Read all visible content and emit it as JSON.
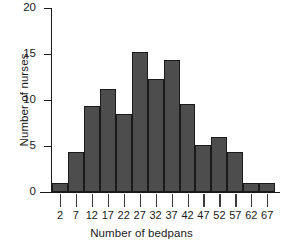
{
  "chart_data": {
    "type": "bar",
    "title": "",
    "subtitle": "",
    "xlabel": "Number of bedpans",
    "ylabel": "Number of nurses",
    "categories": [
      "2",
      "7",
      "12",
      "17",
      "22",
      "27",
      "32",
      "37",
      "42",
      "47",
      "52",
      "57",
      "62",
      "67"
    ],
    "values": [
      1,
      4.3,
      9.4,
      11.2,
      8.5,
      15.2,
      12.3,
      14.3,
      9.6,
      5.1,
      6,
      4.4,
      1,
      1
    ],
    "x_tick_labels": [
      "2",
      "7",
      "12",
      "17",
      "22",
      "27",
      "32",
      "37",
      "42",
      "47",
      "52",
      "57",
      "62",
      "67"
    ],
    "y_tick_labels": [
      "0",
      "5",
      "10",
      "15",
      "20"
    ],
    "y_tick_values": [
      0,
      5,
      10,
      15,
      20
    ],
    "ylim": [
      0,
      20
    ],
    "grid": false,
    "legend": null,
    "bin_width": 5,
    "bar_fill_color": "#4d4d4d",
    "bar_edge_color": "#1a1a1a",
    "axis_color": "#1a1a1a",
    "background_color": "#ffffff"
  },
  "axes": {
    "y_title": "Number of nurses",
    "x_title": "Number of bedpans"
  }
}
